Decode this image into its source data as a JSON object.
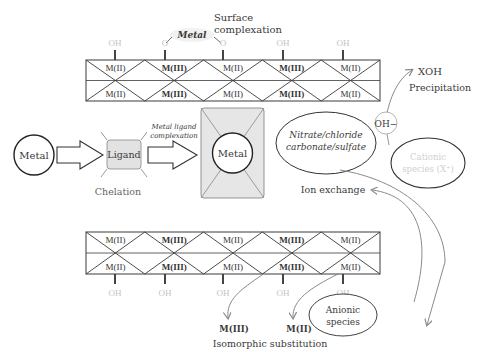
{
  "top_layer": {
    "title_line1": "Surface",
    "title_line2": "complexation",
    "metal_tag": "Metal",
    "pins": [
      "OH",
      "O",
      "O",
      "OH",
      "OH"
    ],
    "upper_cells": [
      "M(II)",
      "M(III)",
      "M(II)",
      "M(III)",
      "M(II)"
    ],
    "lower_cells": [
      "M(II)",
      "M(III)",
      "M(II)",
      "M(III)",
      "M(II)"
    ],
    "bold_cells": [
      false,
      true,
      false,
      true,
      false
    ]
  },
  "bottom_layer": {
    "upper_cells": [
      "M(II)",
      "M(III)",
      "M(II)",
      "M(III)",
      "M(II)"
    ],
    "lower_cells": [
      "M(II)",
      "M(III)",
      "M(II)",
      "M(III)",
      "M(II)"
    ],
    "bold_cells": [
      false,
      true,
      false,
      true,
      false
    ],
    "pins": [
      "OH",
      "OH",
      "OH",
      "OH",
      "OH"
    ]
  },
  "chelation": {
    "metal_label": "Metal",
    "ligand_label": "Ligand",
    "complexation_line1": "Metal ligand",
    "complexation_line2": "complexation",
    "complex_metal_label": "Metal",
    "caption": "Chelation"
  },
  "ion_exchange": {
    "anion_line1": "Nitrate/chloride",
    "anion_line2": "carbonate/sulfate",
    "caption": "Ion exchange",
    "anionic_line1": "Anionic",
    "anionic_line2": "species"
  },
  "precipitation": {
    "hydroxide": "OH−",
    "product": "XOH",
    "caption": "Precipitation",
    "cationic_line1": "Cationic",
    "cationic_line2": "species (X⁺)"
  },
  "isomorphic": {
    "left_label": "M(III)",
    "right_label": "M(II)",
    "caption": "Isomorphic substitution"
  },
  "colors": {
    "line": "#3a3a3a",
    "box_fill": "#e6e6e6",
    "faded_text": "#c4c4c4",
    "arrow": "#8a8a8a"
  }
}
